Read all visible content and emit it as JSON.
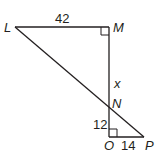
{
  "diagram": {
    "type": "geometry",
    "points": {
      "L": "L",
      "M": "M",
      "N": "N",
      "O": "O",
      "P": "P"
    },
    "segments": {
      "LM": "42",
      "MN": "x",
      "NO": "12",
      "OP": "14"
    },
    "right_angles": [
      "M",
      "O"
    ],
    "line_color": "#231f20"
  }
}
